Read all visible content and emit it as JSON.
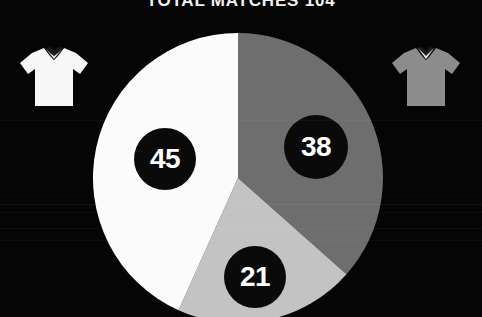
{
  "header": {
    "title": "TOTAL MATCHES 104"
  },
  "teams": {
    "left": {
      "icon": "jersey-icon",
      "shirt_color": "#f7f7f7",
      "collar_color": "#1a1a1a"
    },
    "right": {
      "icon": "jersey-icon",
      "shirt_color": "#8c8c8c",
      "collar_color": "#1a1a1a"
    }
  },
  "chart_data": {
    "type": "pie",
    "title": "TOTAL MATCHES 104",
    "total": 104,
    "total_label": "104",
    "categories": [
      "45",
      "38",
      "21"
    ],
    "values": [
      45,
      38,
      21
    ],
    "labels": [
      "45",
      "38",
      "21"
    ],
    "colors": [
      "#fbfbfb",
      "#6e6e6e",
      "#c3c3c3"
    ],
    "start_angle_deg": 0,
    "direction": "clockwise",
    "legend": "none",
    "grid": false,
    "label_style": {
      "shape": "circle",
      "background": "#0a0a0a",
      "text_color": "#ffffff"
    },
    "geometry": {
      "center_x": 238,
      "center_y": 178,
      "radius": 145
    },
    "slices": [
      {
        "label": "38",
        "value": 38,
        "color": "#6e6e6e",
        "sweep_deg": 131.5,
        "start_deg": 0
      },
      {
        "label": "21",
        "value": 21,
        "color": "#c3c3c3",
        "sweep_deg": 72.7,
        "start_deg": 131.5
      },
      {
        "label": "45",
        "value": 45,
        "color": "#fbfbfb",
        "sweep_deg": 155.8,
        "start_deg": 204.2
      }
    ]
  },
  "theme": {
    "background": "#050505",
    "title_color": "#f2f2f2"
  }
}
